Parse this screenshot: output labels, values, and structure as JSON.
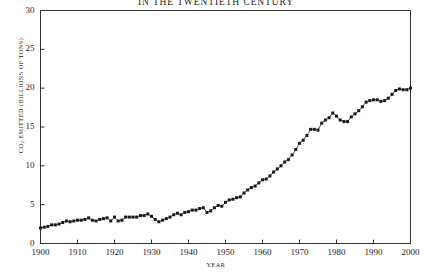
{
  "chart_data": {
    "type": "line",
    "title": "IN THE TWENTIETH CENTURY",
    "xlabel": "YEAR",
    "ylabel": "CO2 EMITTED (BILLIONS OF TONS)",
    "ylabel_prefix": "CO",
    "ylabel_sub": "2",
    "ylabel_suffix": " EMITTED (BILLIONS OF TONS)",
    "xlim": [
      1900,
      2000
    ],
    "ylim": [
      0,
      30
    ],
    "xticks": [
      1900,
      1910,
      1920,
      1930,
      1940,
      1950,
      1960,
      1970,
      1980,
      1990,
      2000
    ],
    "yticks": [
      0,
      5,
      10,
      15,
      20,
      25,
      30
    ],
    "grid": false,
    "legend": "none",
    "marker": "filled-square",
    "line_color": "#222222",
    "marker_color": "#1a1a1a",
    "frame_color": "#333333",
    "background": "#ffffff",
    "x": [
      1900,
      1901,
      1902,
      1903,
      1904,
      1905,
      1906,
      1907,
      1908,
      1909,
      1910,
      1911,
      1912,
      1913,
      1914,
      1915,
      1916,
      1917,
      1918,
      1919,
      1920,
      1921,
      1922,
      1923,
      1924,
      1925,
      1926,
      1927,
      1928,
      1929,
      1930,
      1931,
      1932,
      1933,
      1934,
      1935,
      1936,
      1937,
      1938,
      1939,
      1940,
      1941,
      1942,
      1943,
      1944,
      1945,
      1946,
      1947,
      1948,
      1949,
      1950,
      1951,
      1952,
      1953,
      1954,
      1955,
      1956,
      1957,
      1958,
      1959,
      1960,
      1961,
      1962,
      1963,
      1964,
      1965,
      1966,
      1967,
      1968,
      1969,
      1970,
      1971,
      1972,
      1973,
      1974,
      1975,
      1976,
      1977,
      1978,
      1979,
      1980,
      1981,
      1982,
      1983,
      1984,
      1985,
      1986,
      1987,
      1988,
      1989,
      1990,
      1991,
      1992,
      1993,
      1994,
      1995,
      1996,
      1997,
      1998,
      1999,
      2000
    ],
    "values": [
      2.0,
      2.1,
      2.2,
      2.4,
      2.4,
      2.5,
      2.7,
      2.9,
      2.8,
      2.9,
      3.0,
      3.0,
      3.1,
      3.3,
      3.0,
      2.9,
      3.1,
      3.2,
      3.3,
      2.9,
      3.4,
      2.9,
      3.0,
      3.4,
      3.4,
      3.4,
      3.4,
      3.6,
      3.6,
      3.8,
      3.5,
      3.1,
      2.8,
      3.0,
      3.2,
      3.4,
      3.7,
      3.9,
      3.7,
      4.0,
      4.1,
      4.3,
      4.3,
      4.5,
      4.6,
      4.0,
      4.2,
      4.6,
      4.9,
      4.8,
      5.3,
      5.6,
      5.7,
      5.9,
      6.0,
      6.5,
      6.9,
      7.2,
      7.4,
      7.8,
      8.2,
      8.3,
      8.7,
      9.2,
      9.6,
      10.0,
      10.5,
      10.8,
      11.4,
      12.1,
      12.9,
      13.3,
      13.9,
      14.7,
      14.7,
      14.6,
      15.5,
      15.9,
      16.2,
      16.8,
      16.4,
      15.9,
      15.7,
      15.7,
      16.3,
      16.7,
      17.1,
      17.6,
      18.2,
      18.4,
      18.5,
      18.5,
      18.3,
      18.4,
      18.7,
      19.2,
      19.7,
      19.9,
      19.8,
      19.8,
      20.0
    ],
    "display_values": [
      2.0,
      2.1,
      2.2,
      2.4,
      2.4,
      2.5,
      2.7,
      2.9,
      2.8,
      2.9,
      3.0,
      3.0,
      3.1,
      3.3,
      3.0,
      2.9,
      3.1,
      3.2,
      3.3,
      2.9,
      3.4,
      2.9,
      3.0,
      3.4,
      3.4,
      3.4,
      3.4,
      3.6,
      3.6,
      3.8,
      3.5,
      3.1,
      2.8,
      3.0,
      3.2,
      3.4,
      3.7,
      3.9,
      3.7,
      4.0,
      4.1,
      4.3,
      4.3,
      4.5,
      4.6,
      4.0,
      4.2,
      4.6,
      4.9,
      4.8,
      5.3,
      5.6,
      5.7,
      5.9,
      6.0,
      6.5,
      6.9,
      7.2,
      7.4,
      7.8,
      8.2,
      8.3,
      8.7,
      9.2,
      9.6,
      10.0,
      10.5,
      10.8,
      11.4,
      12.1,
      12.9,
      13.3,
      13.9,
      14.7,
      14.7,
      14.6,
      15.5,
      15.9,
      16.2,
      16.8,
      16.4,
      15.9,
      15.7,
      15.7,
      16.3,
      16.7,
      17.1,
      17.6,
      18.2,
      18.4,
      18.5,
      18.5,
      18.3,
      18.4,
      18.7,
      19.2,
      19.7,
      19.9,
      19.8,
      19.8,
      20.0
    ]
  }
}
